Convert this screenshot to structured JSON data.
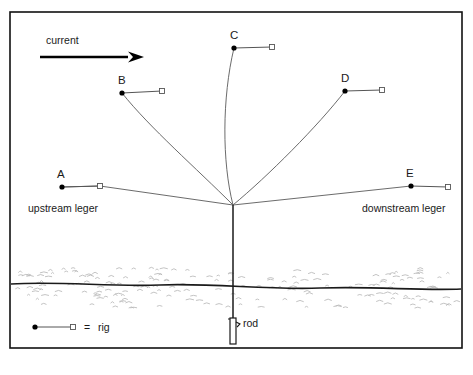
{
  "figure": {
    "frame": {
      "x": 10,
      "y": 12,
      "width": 452,
      "height": 336
    },
    "current_arrow": {
      "label": "current",
      "label_x": 46,
      "label_y": 44,
      "shaft_x1": 40,
      "shaft_x2": 128,
      "shaft_y": 57,
      "tip_x": 144
    },
    "rig_marks": [
      {
        "id": "A",
        "label": "A",
        "label_x": 57,
        "label_y": 178,
        "dot_x": 62,
        "dot_y": 187,
        "square_x": 100,
        "square_y": 186,
        "curve": "M 62 187 L 100 186 L 233 205"
      },
      {
        "id": "B",
        "label": "B",
        "label_x": 118,
        "label_y": 84,
        "dot_x": 122,
        "dot_y": 93,
        "square_x": 162,
        "square_y": 91,
        "curve": "M 122 93 C 150 128 196 168 233 205"
      },
      {
        "id": "C",
        "label": "C",
        "label_x": 230,
        "label_y": 39,
        "dot_x": 234,
        "dot_y": 48,
        "square_x": 272,
        "square_y": 47,
        "curve": "M 234 48 C 222 98 222 162 233 205"
      },
      {
        "id": "D",
        "label": "D",
        "label_x": 341,
        "label_y": 82,
        "dot_x": 345,
        "dot_y": 91,
        "square_x": 382,
        "square_y": 90,
        "curve": "M 345 91 C 318 126 268 176 233 205"
      },
      {
        "id": "E",
        "label": "E",
        "label_x": 406,
        "label_y": 177,
        "dot_x": 411,
        "dot_y": 186,
        "square_x": 448,
        "square_y": 187,
        "curve": "M 411 186 L 233 205"
      }
    ],
    "converge_point": {
      "x": 233,
      "y": 205
    },
    "annotations": [
      {
        "id": "upstream",
        "text": "upstream leger",
        "x": 28,
        "y": 212
      },
      {
        "id": "downstream",
        "text": "downstream leger",
        "x": 362,
        "y": 212
      },
      {
        "id": "rod",
        "text": "rod",
        "x": 243,
        "y": 327
      }
    ],
    "water": {
      "surface_path": "M 11 284 C 60 281 110 287 160 285 C 215 283 265 290 320 288 C 375 286 420 291 461 289",
      "band_top": 268,
      "band_bottom": 308
    },
    "rod": {
      "top_y": 205,
      "bottom_y": 344,
      "x": 233,
      "handle_top": 318,
      "handle_bottom": 344,
      "reel_y": 322
    },
    "legend": {
      "dot_x": 35,
      "dot_y": 327,
      "square_x": 73,
      "square_y": 327,
      "equals": "=",
      "equals_x": 84,
      "text": "rig",
      "text_x": 98
    },
    "colors": {
      "ink": "#111111",
      "line": "#555555",
      "stipple": "#b8b8b8",
      "background": "#ffffff"
    }
  }
}
